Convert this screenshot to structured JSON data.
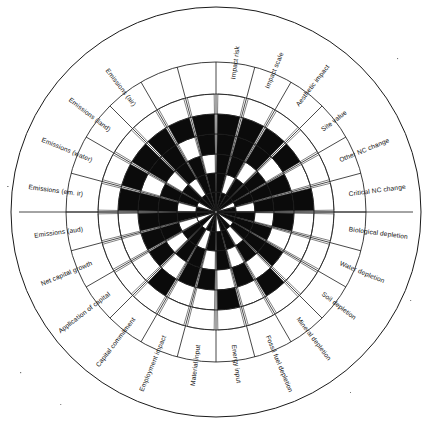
{
  "figure": {
    "title": "",
    "background_color": "#ffffff",
    "ink_color": "#0b0b0b",
    "grid_color": "#1a1a1a"
  },
  "chart_data": {
    "type": "bar",
    "subtype": "polar-rose-grid",
    "title": "",
    "subtitle": "",
    "xlabel": "",
    "ylabel": "",
    "grid": true,
    "legend_position": "none",
    "axis_count": 24,
    "ring_count": 6,
    "ring_levels": [
      1,
      2,
      3,
      4,
      5,
      6
    ],
    "radial_range": [
      0,
      6
    ],
    "value_encoding": "filled ring cells per axis (1 = filled black, 0 = empty white)",
    "start_angle_deg": -90,
    "direction": "clockwise",
    "categories": [
      "Impact risk",
      "Impact scale",
      "Aesthetic impact",
      "Site value",
      "Other NC change",
      "Critical NC change",
      "Biological depletion",
      "Water depletion",
      "Soil depletion",
      "Mineral depletion",
      "Fossil fuel depletion",
      "Energy input",
      "Material input",
      "Employment impact",
      "Capital commitment",
      "Application of capital",
      "Net capital growth",
      "Emissions (aud)",
      "Emissions (em. ir)",
      "Emissions (water)",
      "Emissions (land)",
      "Emissions (air)",
      "Impact risk B",
      "Impact scale B"
    ],
    "series": [
      {
        "name": "Filled ring cells",
        "cells": [
          [
            1,
            1,
            1,
            1,
            1,
            0
          ],
          [
            1,
            0,
            1,
            1,
            1,
            0
          ],
          [
            1,
            1,
            0,
            1,
            1,
            0
          ],
          [
            1,
            1,
            1,
            0,
            1,
            0
          ],
          [
            0,
            1,
            1,
            1,
            0,
            0
          ],
          [
            1,
            0,
            1,
            1,
            1,
            0
          ],
          [
            1,
            1,
            0,
            1,
            0,
            0
          ],
          [
            1,
            1,
            1,
            0,
            0,
            0
          ],
          [
            0,
            1,
            1,
            1,
            0,
            0
          ],
          [
            1,
            0,
            1,
            0,
            1,
            0
          ],
          [
            1,
            1,
            0,
            1,
            0,
            0
          ],
          [
            0,
            1,
            1,
            0,
            1,
            0
          ],
          [
            1,
            1,
            0,
            1,
            0,
            0
          ],
          [
            1,
            0,
            1,
            1,
            0,
            0
          ],
          [
            0,
            1,
            1,
            0,
            1,
            0
          ],
          [
            1,
            1,
            0,
            1,
            0,
            0
          ],
          [
            0,
            0,
            1,
            1,
            0,
            0
          ],
          [
            1,
            1,
            1,
            1,
            0,
            0
          ],
          [
            1,
            0,
            1,
            1,
            1,
            0
          ],
          [
            0,
            1,
            1,
            0,
            1,
            0
          ],
          [
            1,
            1,
            0,
            1,
            1,
            0
          ],
          [
            1,
            0,
            1,
            1,
            1,
            0
          ],
          [
            1,
            1,
            1,
            0,
            1,
            0
          ],
          [
            1,
            1,
            0,
            1,
            1,
            0
          ]
        ],
        "values": [
          5,
          4,
          4,
          4,
          3,
          4,
          3,
          3,
          3,
          3,
          3,
          3,
          3,
          3,
          3,
          3,
          2,
          4,
          4,
          3,
          4,
          4,
          4,
          4
        ]
      }
    ],
    "tick_labels": [],
    "annotations": []
  },
  "labels": {
    "axes": [
      {
        "id": "impact-risk",
        "text": "Impact risk"
      },
      {
        "id": "impact-scale",
        "text": "Impact scale"
      },
      {
        "id": "aesthetic-impact",
        "text": "Aesthetic impact"
      },
      {
        "id": "site-value",
        "text": "Site value"
      },
      {
        "id": "other-nc-change",
        "text": "Other NC change"
      },
      {
        "id": "critical-nc-change",
        "text": "Critical NC change"
      },
      {
        "id": "biological-depletion",
        "text": "Biological depletion"
      },
      {
        "id": "water-depletion",
        "text": "Water depletion"
      },
      {
        "id": "soil-depletion",
        "text": "Soil depletion"
      },
      {
        "id": "mineral-depletion",
        "text": "Mineral depletion"
      },
      {
        "id": "fossil-fuel-depletion",
        "text": "Fossil fuel depletion"
      },
      {
        "id": "energy-input",
        "text": "Energy input"
      },
      {
        "id": "material-input",
        "text": "Material input"
      },
      {
        "id": "employment-impact",
        "text": "Employment impact"
      },
      {
        "id": "capital-commitment",
        "text": "Capital commitment"
      },
      {
        "id": "application-of-capital",
        "text": "Application of capital"
      },
      {
        "id": "net-capital-growth",
        "text": "Net capital growth"
      },
      {
        "id": "emissions-aud",
        "text": "Emissions (aud)"
      },
      {
        "id": "emissions-em-ir",
        "text": "Emissions (em. ir)"
      },
      {
        "id": "emissions-water",
        "text": "Emissions (water)"
      },
      {
        "id": "emissions-land",
        "text": "Emissions (land)"
      },
      {
        "id": "emissions-air",
        "text": "Emissions (air)"
      },
      {
        "id": "unlabeled-1",
        "text": ""
      },
      {
        "id": "unlabeled-2",
        "text": ""
      }
    ]
  },
  "geometry": {
    "center_x": 216,
    "center_y": 212,
    "outer_radius": 205,
    "label_ring_radius": 150,
    "data_radius": 118,
    "ring_radii": [
      20,
      39,
      58,
      78,
      98,
      118
    ]
  }
}
